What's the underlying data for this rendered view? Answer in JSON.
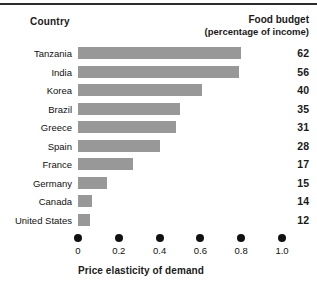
{
  "headers": {
    "country": "Country",
    "budget_line1": "Food budget",
    "budget_line2": "(percentage of income)"
  },
  "axis": {
    "title": "Price elasticity of demand",
    "tick_labels": [
      "0",
      "0.2",
      "0.4",
      "0.6",
      "0.8",
      "1.0"
    ],
    "tick_values": [
      0,
      0.2,
      0.4,
      0.6,
      0.8,
      1.0
    ],
    "min": 0,
    "max": 1.0
  },
  "colors": {
    "bar": "#989898",
    "text": "#111111",
    "rule": "#2b2b2b"
  },
  "chart_data": {
    "type": "bar",
    "orientation": "horizontal",
    "title": "",
    "xlabel": "Price elasticity of demand",
    "ylabel": "Country",
    "xlim": [
      0,
      1.0
    ],
    "grid": false,
    "legend": false,
    "categories": [
      "Tanzania",
      "India",
      "Korea",
      "Brazil",
      "Greece",
      "Spain",
      "France",
      "Germany",
      "Canada",
      "United States"
    ],
    "series": [
      {
        "name": "Price elasticity of demand",
        "values": [
          0.8,
          0.79,
          0.61,
          0.5,
          0.48,
          0.4,
          0.27,
          0.14,
          0.07,
          0.06
        ]
      },
      {
        "name": "Food budget (percentage of income)",
        "values": [
          62,
          56,
          40,
          35,
          31,
          28,
          17,
          15,
          14,
          12
        ]
      }
    ],
    "rows": [
      {
        "country": "Tanzania",
        "elasticity": 0.8,
        "food_budget": "62"
      },
      {
        "country": "India",
        "elasticity": 0.79,
        "food_budget": "56"
      },
      {
        "country": "Korea",
        "elasticity": 0.61,
        "food_budget": "40"
      },
      {
        "country": "Brazil",
        "elasticity": 0.5,
        "food_budget": "35"
      },
      {
        "country": "Greece",
        "elasticity": 0.48,
        "food_budget": "31"
      },
      {
        "country": "Spain",
        "elasticity": 0.4,
        "food_budget": "28"
      },
      {
        "country": "France",
        "elasticity": 0.27,
        "food_budget": "17"
      },
      {
        "country": "Germany",
        "elasticity": 0.14,
        "food_budget": "15"
      },
      {
        "country": "Canada",
        "elasticity": 0.07,
        "food_budget": "14"
      },
      {
        "country": "United States",
        "elasticity": 0.06,
        "food_budget": "12"
      }
    ]
  }
}
